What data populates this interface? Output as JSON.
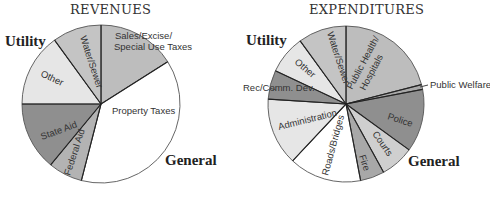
{
  "chart_data": [
    {
      "type": "pie",
      "title": "REVENUES",
      "group_labels": [
        "Utility",
        "General"
      ],
      "slices": [
        {
          "label": "Sales/Excise/ Special Use Taxes",
          "value": 16,
          "group": "General",
          "color": "#bdbdbd"
        },
        {
          "label": "Property Taxes",
          "value": 38,
          "group": "General",
          "color": "#ffffff"
        },
        {
          "label": "Federal Aid",
          "value": 7,
          "group": "General",
          "color": "#b3b3b3"
        },
        {
          "label": "State Aid",
          "value": 14,
          "group": "General",
          "color": "#8f8f8f"
        },
        {
          "label": "Other",
          "value": 15,
          "group": "Utility",
          "color": "#e6e6e6"
        },
        {
          "label": "Water/Sewer",
          "value": 10,
          "group": "Utility",
          "color": "#c4c4c4"
        }
      ],
      "unit": "percent (estimated)"
    },
    {
      "type": "pie",
      "title": "EXPENDITURES",
      "group_labels": [
        "Utility",
        "General"
      ],
      "slices": [
        {
          "label": "Public Health/ Hospitals",
          "value": 21,
          "group": "General",
          "color": "#bdbdbd"
        },
        {
          "label": "Public Welfare",
          "value": 1,
          "group": "General",
          "color": "#a8a8a8"
        },
        {
          "label": "Police",
          "value": 13,
          "group": "General",
          "color": "#8f8f8f"
        },
        {
          "label": "Courts",
          "value": 7,
          "group": "General",
          "color": "#cfcfcf"
        },
        {
          "label": "Fire",
          "value": 5,
          "group": "General",
          "color": "#a8a8a8"
        },
        {
          "label": "Roads/Bridges",
          "value": 15,
          "group": "General",
          "color": "#ffffff"
        },
        {
          "label": "Administration",
          "value": 14,
          "group": "General",
          "color": "#e6e6e6"
        },
        {
          "label": "Rec/Comm. Dev.",
          "value": 6,
          "group": "General",
          "color": "#8f8f8f"
        },
        {
          "label": "Other",
          "value": 8,
          "group": "Utility",
          "color": "#e6e6e6"
        },
        {
          "label": "Water/Sewer",
          "value": 10,
          "group": "Utility",
          "color": "#c4c4c4"
        }
      ],
      "unit": "percent (estimated)"
    }
  ],
  "revenues": {
    "title": "REVENUES",
    "utility": "Utility",
    "general": "General",
    "labels": {
      "sales1": "Sales/Excise/",
      "sales2": "Special Use Taxes",
      "property": "Property Taxes",
      "federal": "Federal Aid",
      "state": "State Aid",
      "other": "Other",
      "water": "Water/Sewer"
    }
  },
  "expenditures": {
    "title": "EXPENDITURES",
    "utility": "Utility",
    "general": "General",
    "labels": {
      "health1": "Public Health/",
      "health2": "Hospitals",
      "welfare": "Public Welfare",
      "police": "Police",
      "courts": "Courts",
      "fire": "Fire",
      "roads": "Roads/Bridges",
      "admin": "Administration",
      "rec": "Rec/Comm. Dev.",
      "other": "Other",
      "water": "Water/Sewer"
    }
  }
}
